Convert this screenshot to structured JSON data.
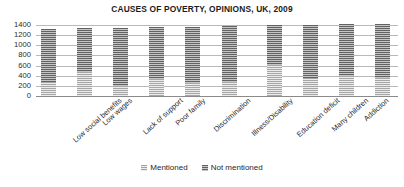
{
  "chart_data": {
    "type": "bar",
    "subtype": "stacked-column",
    "title": "CAUSES OF POVERTY, OPINIONS, UK, 2009",
    "xlabel": "",
    "ylabel": "",
    "ylim": [
      0,
      1400
    ],
    "yticks": [
      0,
      200,
      400,
      600,
      800,
      1000,
      1200,
      1400
    ],
    "ytick_labels": [
      "0",
      "200",
      "400",
      "600",
      "800",
      "1000",
      "1200",
      "1400"
    ],
    "grid": true,
    "grid_axis": "y",
    "legend_position": "bottom",
    "categories": [
      "Low social benefits",
      "Low wages",
      "Lack of support",
      "Poor family",
      "Discrimination",
      "Illness/Disability",
      "Education deficit",
      "Many children",
      "Addiction",
      "Live beyond means"
    ],
    "series": [
      {
        "name": "Mentioned",
        "color": "#cfcfcf",
        "values": [
          280,
          470,
          200,
          330,
          260,
          270,
          620,
          350,
          390,
          350
        ]
      },
      {
        "name": "Not mentioned",
        "color": "#8d8d8d",
        "values": [
          1050,
          870,
          1150,
          1030,
          1110,
          1110,
          790,
          1060,
          1025,
          1070
        ]
      }
    ],
    "totals": [
      1330,
      1340,
      1350,
      1360,
      1370,
      1380,
      1410,
      1410,
      1415,
      1420
    ]
  },
  "legend": {
    "items": [
      {
        "label": "Mentioned",
        "swatch": "legend-swatch-mentioned"
      },
      {
        "label": "Not mentioned",
        "swatch": "legend-swatch-not-mentioned"
      }
    ]
  }
}
